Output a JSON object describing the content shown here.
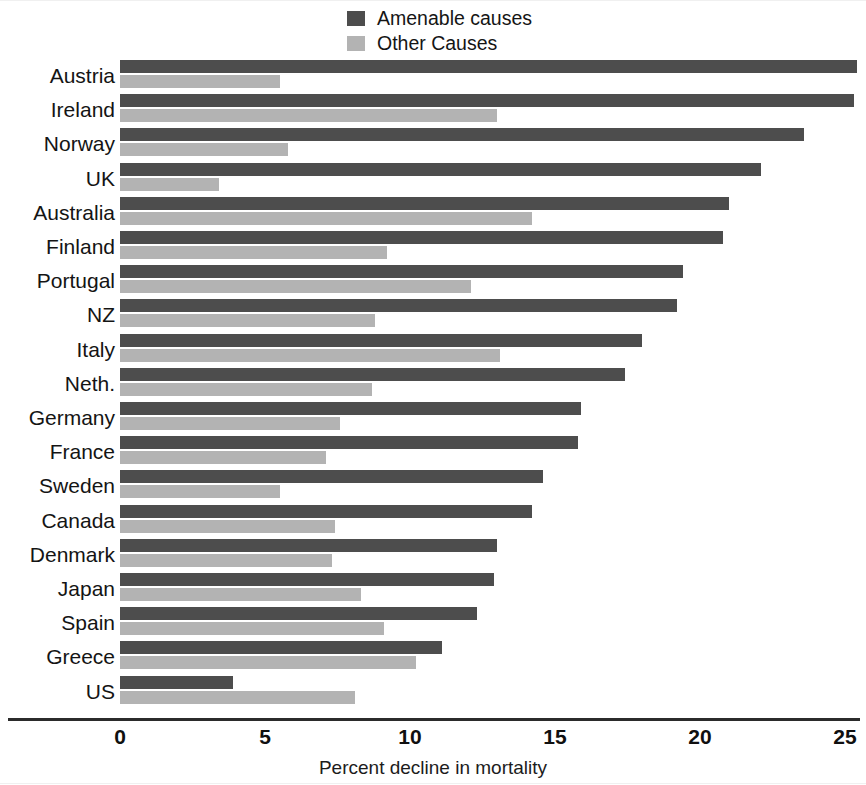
{
  "legend": {
    "position": "top-center",
    "items": [
      {
        "label": "Amenable causes",
        "color": "#4d4d4d",
        "icon": "square-swatch-icon"
      },
      {
        "label": "Other Causes",
        "color": "#b3b3b3",
        "icon": "square-swatch-icon"
      }
    ]
  },
  "axis": {
    "x_title": "Percent decline in mortality",
    "ticks": [
      "0",
      "5",
      "10",
      "15",
      "20",
      "25"
    ]
  },
  "chart_data": {
    "type": "bar",
    "orientation": "horizontal",
    "title": "",
    "subtitle": "",
    "xlabel": "Percent decline in mortality",
    "ylabel": "",
    "xlim": [
      0,
      25
    ],
    "xticks": [
      0,
      5,
      10,
      15,
      20,
      25
    ],
    "grid": false,
    "legend_position": "top-center",
    "categories": [
      "Austria",
      "Ireland",
      "Norway",
      "UK",
      "Australia",
      "Finland",
      "Portugal",
      "NZ",
      "Italy",
      "Neth.",
      "Germany",
      "France",
      "Sweden",
      "Canada",
      "Denmark",
      "Japan",
      "Spain",
      "Greece",
      "US"
    ],
    "series": [
      {
        "name": "Amenable causes",
        "color": "#4d4d4d",
        "values": [
          25.4,
          25.3,
          23.6,
          22.1,
          21.0,
          20.8,
          19.4,
          19.2,
          18.0,
          17.4,
          15.9,
          15.8,
          14.6,
          14.2,
          13.0,
          12.9,
          12.3,
          11.1,
          3.9
        ]
      },
      {
        "name": "Other Causes",
        "color": "#b3b3b3",
        "values": [
          5.5,
          13.0,
          5.8,
          3.4,
          14.2,
          9.2,
          12.1,
          8.8,
          13.1,
          8.7,
          7.6,
          7.1,
          5.5,
          7.4,
          7.3,
          8.3,
          9.1,
          10.2,
          8.1
        ]
      }
    ]
  }
}
